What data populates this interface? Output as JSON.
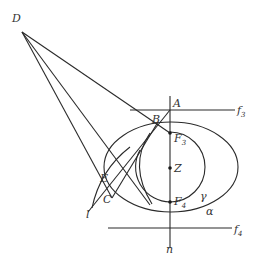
{
  "labels": {
    "D": "D",
    "A": "A",
    "B": "B",
    "E": "E",
    "C": "C",
    "l": "l",
    "Z": "Z",
    "F3": "F",
    "F3_sub": "3",
    "F4": "F",
    "F4_sub": "4",
    "f3": "f",
    "f3_sub": "3",
    "f4": "f",
    "f4_sub": "4",
    "n": "n",
    "gamma": "γ",
    "alpha": "α"
  }
}
